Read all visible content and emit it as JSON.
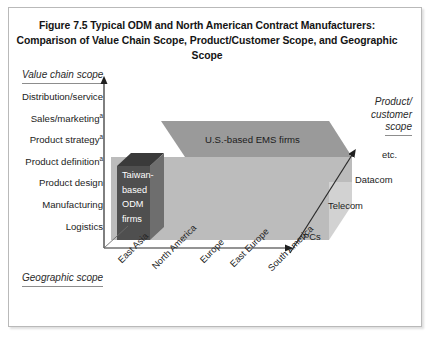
{
  "figure": {
    "title_line1": "Figure 7.5 Typical ODM and North American Contract Manufacturers:",
    "title_line2": "Comparison of Value Chain Scope, Product/Customer Scope, and Geographic Scope"
  },
  "axes": {
    "value_chain": {
      "caption": "Value chain scope",
      "labels": [
        {
          "text": "Distribution/service",
          "marker": ""
        },
        {
          "text": "Sales/marketing",
          "marker": "a"
        },
        {
          "text": "Product strategy",
          "marker": "a"
        },
        {
          "text": "Product definition",
          "marker": "a"
        },
        {
          "text": "Product design",
          "marker": ""
        },
        {
          "text": "Manufacturing",
          "marker": ""
        },
        {
          "text": "Logistics",
          "marker": ""
        }
      ]
    },
    "geographic": {
      "caption": "Geographic scope",
      "labels": [
        "East Asia",
        "North America",
        "Europe",
        "East Europe",
        "South America"
      ]
    },
    "product_customer": {
      "caption_line1": "Product/",
      "caption_line2": "customer",
      "caption_line3": "scope",
      "labels": [
        "PCs",
        "Telecom",
        "Datacom",
        "etc."
      ]
    }
  },
  "boxes": {
    "ems": {
      "label": "U.S.-based EMS firms"
    },
    "odm": {
      "label_line1": "Taiwan-",
      "label_line2": "based",
      "label_line3": "ODM",
      "label_line4": "firms"
    }
  },
  "colors": {
    "frame_border": "#b9b9b9",
    "ems_top": "#9a9a9a",
    "ems_front": "#bcbcbc",
    "ems_side": "#d2d2d2",
    "odm_front": "#4f4f4f",
    "odm_top": "#3a3a3a",
    "odm_side": "#6e6e6e",
    "axis_line": "#404040",
    "text": "#232323"
  }
}
